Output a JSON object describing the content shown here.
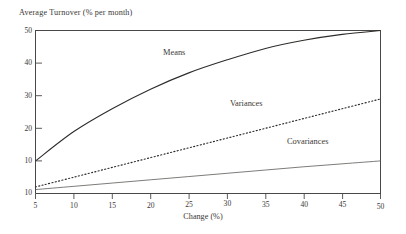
{
  "chart_data": {
    "type": "line",
    "title": "Average Turnover (% per month)",
    "xlabel": "Change (%)",
    "ylabel": "Average Turnover (% per month)",
    "xlim": [
      5,
      50
    ],
    "ylim": [
      0,
      50
    ],
    "grid": false,
    "legend_position": "inline-annotations",
    "xticks": [
      5,
      10,
      15,
      20,
      25,
      30,
      35,
      40,
      45,
      50
    ],
    "xtick_labels": [
      "5",
      "10",
      "15",
      "20",
      "25",
      "30",
      "35",
      "40",
      "45",
      "50"
    ],
    "yticks": [
      0,
      10,
      20,
      30,
      40,
      50
    ],
    "ytick_labels": [
      "10",
      "10",
      "20",
      "30",
      "40",
      "50"
    ],
    "x": [
      5,
      10,
      15,
      20,
      25,
      30,
      35,
      40,
      45,
      50
    ],
    "series": [
      {
        "name": "Means",
        "style": "solid",
        "color": "#2e2c2a",
        "values": [
          10.0,
          19.0,
          26.0,
          32.0,
          37.0,
          41.0,
          44.5,
          47.0,
          48.8,
          50.0
        ],
        "annotation": "Means"
      },
      {
        "name": "Variances",
        "style": "dotted",
        "color": "#2e2c2a",
        "values": [
          2.0,
          5.0,
          8.0,
          11.0,
          14.0,
          17.0,
          20.0,
          23.0,
          26.0,
          29.0
        ],
        "annotation": "Variances"
      },
      {
        "name": "Covariances",
        "style": "solid-thin",
        "color": "#5d5b58",
        "values": [
          1.2,
          2.2,
          3.2,
          4.2,
          5.2,
          6.2,
          7.2,
          8.2,
          9.1,
          10.0
        ],
        "annotation": "Covariances"
      }
    ],
    "annotations": [
      {
        "text": "Means",
        "x_px": 163,
        "y_px": 54
      },
      {
        "text": "Variances",
        "x_px": 230,
        "y_px": 105
      },
      {
        "text": "Covariances",
        "x_px": 287,
        "y_px": 143
      }
    ]
  }
}
